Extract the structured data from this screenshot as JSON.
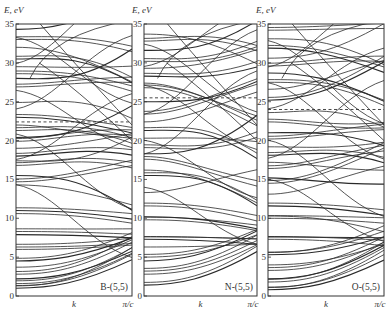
{
  "figure": {
    "y_axis_label": "E, eV",
    "x_axis_labels": [
      "k",
      "π/c"
    ],
    "y_ticks": [
      0,
      5,
      10,
      15,
      20,
      25,
      30,
      35
    ]
  },
  "chart_data": {
    "type": "line",
    "title": "",
    "xlabel": "k",
    "ylabel": "E, eV",
    "ylim": [
      0,
      35
    ],
    "x_ticks": [
      "k",
      "π/c"
    ],
    "grid": false,
    "legend": null,
    "panels": [
      {
        "label": "B-(5,5)",
        "fermi_level_eV": 22.4,
        "band_energies_at_gamma_eV": [
          1.0,
          1.3,
          1.6,
          2.2,
          2.8,
          3.7,
          4.5,
          6.0,
          6.3,
          7.9,
          8.3,
          10.6,
          11.0,
          14.3,
          14.7,
          15.5,
          16.8,
          17.4,
          18.0,
          19.0,
          19.9,
          20.4,
          21.3,
          22.0,
          23.0,
          24.9,
          26.9,
          28.0,
          28.6,
          29.5,
          30.5,
          32.0,
          33.0,
          34.3
        ]
      },
      {
        "label": "N-(5,5)",
        "fermi_level_eV": 25.5,
        "band_energies_at_gamma_eV": [
          1.4,
          2.8,
          3.2,
          4.5,
          5.0,
          6.3,
          7.3,
          7.6,
          9.8,
          10.2,
          11.6,
          13.3,
          15.5,
          16.2,
          17.6,
          18.3,
          19.1,
          20.3,
          21.3,
          22.4,
          23.4,
          25.0,
          26.8,
          27.4,
          28.3,
          29.3,
          30.2,
          31.6,
          32.8,
          33.7
        ]
      },
      {
        "label": "O-(5,5)",
        "fermi_level_eV": 24.0,
        "band_energies_at_gamma_eV": [
          0.8,
          1.1,
          1.8,
          2.2,
          3.3,
          4.0,
          5.3,
          5.6,
          7.3,
          7.6,
          10.0,
          10.3,
          11.6,
          13.1,
          14.5,
          15.2,
          16.4,
          17.2,
          18.1,
          19.2,
          20.2,
          21.0,
          22.4,
          23.6,
          25.2,
          26.6,
          27.5,
          28.7,
          29.6,
          30.6,
          31.9,
          33.1,
          34.2
        ]
      }
    ]
  }
}
